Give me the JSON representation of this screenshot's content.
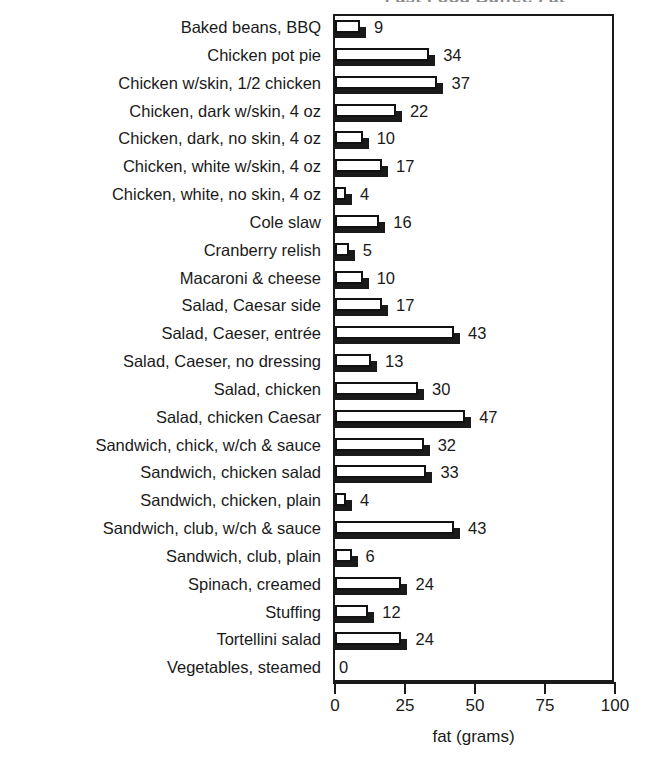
{
  "chart_data": {
    "type": "bar",
    "orientation": "horizontal",
    "title": "Fast Food Buffet, Fat",
    "xlabel": "fat (grams)",
    "ylabel": "",
    "xlim": [
      0,
      100
    ],
    "xticks": [
      0,
      25,
      50,
      75,
      100
    ],
    "xtick_labels": [
      "0",
      "25",
      "50",
      "75",
      "100"
    ],
    "grid": false,
    "legend": false,
    "categories": [
      "Baked beans, BBQ",
      "Chicken pot pie",
      "Chicken w/skin, 1/2 chicken",
      "Chicken, dark w/skin, 4 oz",
      "Chicken, dark, no skin, 4 oz",
      "Chicken, white w/skin, 4 oz",
      "Chicken, white, no skin, 4 oz",
      "Cole slaw",
      "Cranberry relish",
      "Macaroni & cheese",
      "Salad, Caesar side",
      "Salad, Caeser, entrée",
      "Salad, Caeser, no dressing",
      "Salad, chicken",
      "Salad, chicken Caesar",
      "Sandwich, chick, w/ch & sauce",
      "Sandwich, chicken salad",
      "Sandwich, chicken, plain",
      "Sandwich, club, w/ch & sauce",
      "Sandwich, club, plain",
      "Spinach, creamed",
      "Stuffing",
      "Tortellini salad",
      "Vegetables, steamed"
    ],
    "values": [
      9,
      34,
      37,
      22,
      10,
      17,
      4,
      16,
      5,
      10,
      17,
      43,
      13,
      30,
      47,
      32,
      33,
      4,
      43,
      6,
      24,
      12,
      24,
      0
    ],
    "value_labels": [
      "9",
      "34",
      "37",
      "22",
      "10",
      "17",
      "4",
      "16",
      "5",
      "10",
      "17",
      "43",
      "13",
      "30",
      "47",
      "32",
      "33",
      "4",
      "43",
      "6",
      "24",
      "12",
      "24",
      "0"
    ],
    "colors": {
      "bar_face": "#ffffff",
      "bar_outline": "#111111",
      "bar_shadow": "#1a1a1a",
      "axis": "#1a1a1a",
      "text": "#1a1a1a",
      "background": "#ffffff"
    }
  }
}
